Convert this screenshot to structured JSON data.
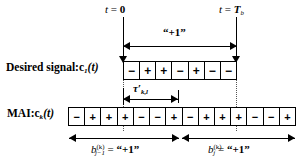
{
  "figure": {
    "type": "timing-diagram"
  },
  "markers": {
    "t_zero": "t = 0",
    "t_zero_parts": {
      "var": "t",
      "eq": " = ",
      "val": "0"
    },
    "t_tb": "t = T",
    "t_tb_parts": {
      "var": "t",
      "eq": " = ",
      "val": "T",
      "sub": "b"
    }
  },
  "bit_label_top": "“+1”",
  "delay_label": {
    "symbol": "τ",
    "prime": "′",
    "sub": "k,l"
  },
  "rows": [
    {
      "name": "desired-signal",
      "label_text": "Desired signal:c",
      "label_sub": "1",
      "label_tail": "(t)",
      "chips": [
        "−",
        "+",
        "+",
        "−",
        "+",
        "−",
        "−"
      ]
    },
    {
      "name": "mai-signal",
      "label_text": "MAI:c",
      "label_sub": "k",
      "label_tail": "(t)",
      "chips": [
        "−",
        "+",
        "+",
        "+",
        "−",
        "−",
        "+",
        "−",
        "+",
        "+",
        "+",
        "−",
        "−",
        "+"
      ]
    }
  ],
  "bottom_measures": [
    {
      "name": "previous-bit",
      "sym": "b",
      "sub": "j−1",
      "sup": "(k)",
      "eq": " = ",
      "value": "“+1”"
    },
    {
      "name": "current-bit",
      "sym": "b",
      "sub": "j",
      "sup": "(k)",
      "eq": " = ",
      "value": "“+1”"
    }
  ],
  "colors": {
    "ink": "#000000",
    "background": "#ffffff",
    "dotted_guide": "#555555"
  }
}
